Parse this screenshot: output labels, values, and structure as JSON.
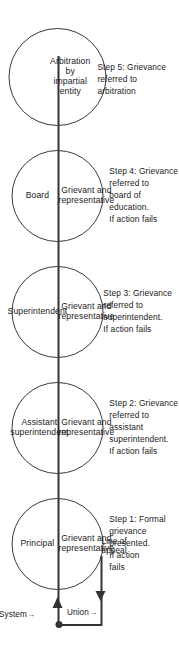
{
  "diagram": {
    "spine_label": "Line of\nappeal",
    "side_labels": {
      "system": "System→",
      "union": "Union→"
    },
    "role_line_label": "Grievant and\nrepresentative",
    "nodes": [
      {
        "id": "principal",
        "authority": "Principal",
        "party": "Grievant and\nrepresentative",
        "step": "Step 1: Formal\ngrievance\npresented.\nIf action\nfails"
      },
      {
        "id": "assistant-superintendent",
        "authority": "Assistant\nsuperintendent",
        "party": "Grievant and\nrepresentative",
        "step": "Step 2: Grievance\nreferred to\nassistant\nsuperintendent.\nIf action fails"
      },
      {
        "id": "superintendent",
        "authority": "Superintendent",
        "party": "Grievant and\nrepresentative",
        "step": "Step 3: Grievance\nreferred to\nsuperintendent.\nIf action fails"
      },
      {
        "id": "board",
        "authority": "Board",
        "party": "Grievant and\nrepresentative",
        "step": "Step 4: Grievance\nreferred to\nboard of\neducation.\nIf action fails"
      },
      {
        "id": "arbitration",
        "authority": "Arbitration\nby\nimpartial\nentity",
        "party": "",
        "step": "Step 5: Grievance\nreferred to\narbitration"
      }
    ],
    "colors": {
      "ink": "#1a1a1a",
      "stroke": "#3a3a3a",
      "spine": "#333333",
      "background": "#ffffff"
    }
  }
}
